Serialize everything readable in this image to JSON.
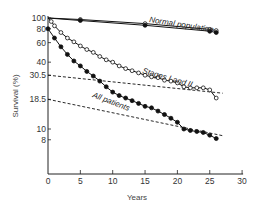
{
  "chart_data": {
    "type": "line",
    "title": "",
    "xlabel": "Years",
    "ylabel": "Survival (%)",
    "yscale": "log",
    "xlim": [
      0,
      30
    ],
    "ylim": [
      6,
      100
    ],
    "grid": false,
    "legend": "inline labels",
    "x_ticks": [
      0,
      5,
      10,
      15,
      20,
      25,
      30
    ],
    "y_ticks": [
      100,
      80,
      60,
      40,
      30.5,
      18.5,
      10,
      8
    ],
    "series": [
      {
        "name": "Normal population (upper)",
        "style": "solid-double-line",
        "marker": "open-circle",
        "x": [
          0,
          5,
          15,
          25,
          26
        ],
        "y": [
          100,
          97,
          89,
          79,
          77
        ]
      },
      {
        "name": "Normal population (lower)",
        "style": "solid-double-line",
        "marker": "filled-circle",
        "x": [
          0,
          5,
          15,
          25,
          26
        ],
        "y": [
          100,
          95,
          86,
          76,
          74
        ]
      },
      {
        "name": "Stages I and II",
        "style": "solid",
        "marker": "open-circle",
        "x": [
          0,
          0.5,
          1,
          2,
          3,
          4,
          5,
          6,
          7,
          8,
          9,
          10,
          11,
          12,
          13,
          14,
          15,
          16,
          17,
          18,
          19,
          20,
          21,
          22,
          23,
          24,
          25,
          26
        ],
        "y": [
          100,
          93,
          85,
          74,
          66,
          61,
          56,
          52,
          49,
          45,
          42,
          40,
          37,
          35,
          33.5,
          32,
          30.5,
          29.5,
          29,
          27.5,
          27,
          26,
          24,
          23.5,
          23.5,
          23.5,
          22.5,
          19
        ]
      },
      {
        "name": "All patients",
        "style": "solid",
        "marker": "filled-circle",
        "x": [
          0,
          1,
          2,
          3,
          4,
          5,
          6,
          7,
          8,
          9,
          10,
          11,
          12,
          13,
          14,
          15,
          16,
          17,
          18,
          19,
          20,
          21,
          22,
          23,
          24,
          25,
          26
        ],
        "y": [
          80,
          66,
          55,
          47,
          41,
          37,
          33,
          30,
          27,
          24,
          21.5,
          20,
          19,
          18,
          17,
          16,
          15.5,
          14.5,
          13.5,
          12.5,
          11.5,
          10,
          9.7,
          9.5,
          9.3,
          8.8,
          8.2
        ]
      },
      {
        "name": "Stages I and II (fitted)",
        "style": "dashed",
        "marker": "none",
        "x": [
          0,
          27
        ],
        "y": [
          30.5,
          21
        ]
      },
      {
        "name": "All patients (fitted)",
        "style": "dashed",
        "marker": "none",
        "x": [
          0,
          27
        ],
        "y": [
          18.5,
          8.7
        ]
      }
    ],
    "annotations": [
      {
        "text": "Normal population",
        "x": 12,
        "y": 100
      },
      {
        "text": "Stages I and II",
        "x": 18,
        "y": 37
      },
      {
        "text": "All patients",
        "x": 12,
        "y": 23
      }
    ]
  },
  "labels": {
    "xlabel": "Years",
    "ylabel": "Survival (%)",
    "normal": "Normal population",
    "stages": "Stages I and II",
    "all": "All patients"
  }
}
